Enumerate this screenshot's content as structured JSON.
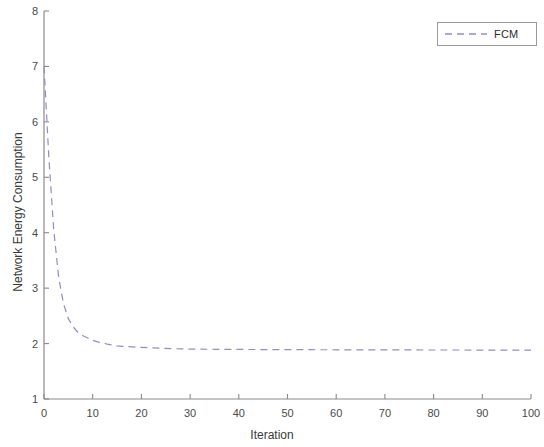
{
  "figure": {
    "background_color": "#ffffff",
    "axis_color": "#8a8a8a"
  },
  "axes": {
    "x_title": "Iteration",
    "y_title": "Network Energy Consumption",
    "x_ticks": [
      "0",
      "10",
      "20",
      "30",
      "40",
      "50",
      "60",
      "70",
      "80",
      "90",
      "100"
    ],
    "y_ticks": [
      "1",
      "2",
      "3",
      "4",
      "5",
      "6",
      "7",
      "8"
    ]
  },
  "legend": {
    "entries": [
      {
        "label": "FCM",
        "color": "#8e8ec8",
        "style": "dashed"
      }
    ]
  },
  "chart_data": {
    "type": "line",
    "title": "",
    "xlabel": "Iteration",
    "ylabel": "Network Energy Consumption",
    "xlim": [
      0,
      100
    ],
    "ylim": [
      1,
      8
    ],
    "xticks": [
      0,
      10,
      20,
      30,
      40,
      50,
      60,
      70,
      80,
      90,
      100
    ],
    "yticks": [
      1,
      2,
      3,
      4,
      5,
      6,
      7,
      8
    ],
    "grid": false,
    "legend_position": "top-right",
    "series": [
      {
        "name": "FCM",
        "color": "#8e8ec8",
        "linestyle": "dashed",
        "linewidth": 1.2,
        "x": [
          0,
          1,
          2,
          3,
          4,
          5,
          6,
          7,
          8,
          9,
          10,
          11,
          12,
          13,
          14,
          15,
          16,
          17,
          18,
          19,
          20,
          22,
          24,
          26,
          28,
          30,
          35,
          40,
          45,
          50,
          55,
          60,
          65,
          70,
          75,
          80,
          85,
          90,
          95,
          100
        ],
        "y": [
          7.0,
          5.35,
          4.05,
          3.2,
          2.72,
          2.45,
          2.3,
          2.2,
          2.14,
          2.1,
          2.06,
          2.03,
          2.01,
          1.99,
          1.975,
          1.96,
          1.95,
          1.945,
          1.94,
          1.935,
          1.93,
          1.922,
          1.915,
          1.91,
          1.905,
          1.9,
          1.897,
          1.894,
          1.892,
          1.89,
          1.889,
          1.888,
          1.887,
          1.886,
          1.885,
          1.884,
          1.884,
          1.883,
          1.883,
          1.882
        ]
      }
    ]
  }
}
